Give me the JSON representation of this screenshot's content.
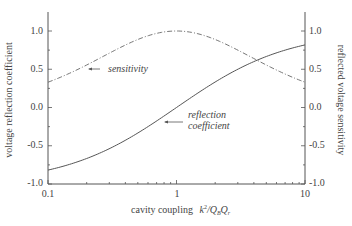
{
  "chart_data": {
    "type": "line",
    "title": "",
    "xlabel": "cavity coupling k²/Q_B Q_r",
    "ylabel": "voltage reflection coefficient",
    "ylabel_right": "reflected voltage sensitivity",
    "xscale": "log",
    "xlim": [
      0.1,
      10
    ],
    "ylim": [
      -1.0,
      1.25
    ],
    "ylim_right": [
      -1.0,
      1.25
    ],
    "x_ticks": [
      "0.1",
      "1",
      "10"
    ],
    "y_ticks": [
      "-1.0",
      "-0.5",
      "0.0",
      "0.5",
      "1.0"
    ],
    "y_ticks_right": [
      "-1.0",
      "-0.5",
      "0.0",
      "0.5",
      "1.0"
    ],
    "grid": false,
    "x": [
      0.1,
      0.2,
      0.3,
      0.5,
      0.7,
      1.0,
      1.5,
      2,
      3,
      4,
      5,
      7,
      10
    ],
    "series": [
      {
        "name": "reflection coefficient",
        "axis": "left",
        "style": "solid",
        "values": [
          -0.818,
          -0.667,
          -0.538,
          -0.333,
          -0.176,
          0.0,
          0.2,
          0.333,
          0.5,
          0.6,
          0.667,
          0.75,
          0.818
        ]
      },
      {
        "name": "sensitivity",
        "axis": "right",
        "style": "dash-dot",
        "values": [
          0.331,
          0.556,
          0.71,
          0.889,
          0.969,
          1.0,
          0.96,
          0.889,
          0.75,
          0.64,
          0.556,
          0.4375,
          0.331
        ]
      }
    ],
    "annotations": [
      {
        "text": "sensitivity",
        "arrow_to": "sensitivity curve near x≈0.2"
      },
      {
        "text": "reflection coefficient",
        "arrow_to": "reflection curve near x≈1.3"
      }
    ]
  },
  "labels": {
    "xlabel_main": "cavity coupling",
    "xlabel_k": "k",
    "xlabel_sup": "2",
    "xlabel_q": "/Q",
    "xlabel_sub1": "B",
    "xlabel_q2": "Q",
    "xlabel_sub2": "r",
    "ylabel": "voltage reflection coefficient",
    "ylabel_right": "reflected voltage sensitivity",
    "annot_sensitivity": "sensitivity",
    "annot_reflection_1": "reflection",
    "annot_reflection_2": "coefficient",
    "xt0": "0.1",
    "xt1": "1",
    "xt2": "10",
    "yt0": "-1.0",
    "yt1": "-0.5",
    "yt2": "0.0",
    "yt3": "0.5",
    "yt4": "1.0"
  }
}
